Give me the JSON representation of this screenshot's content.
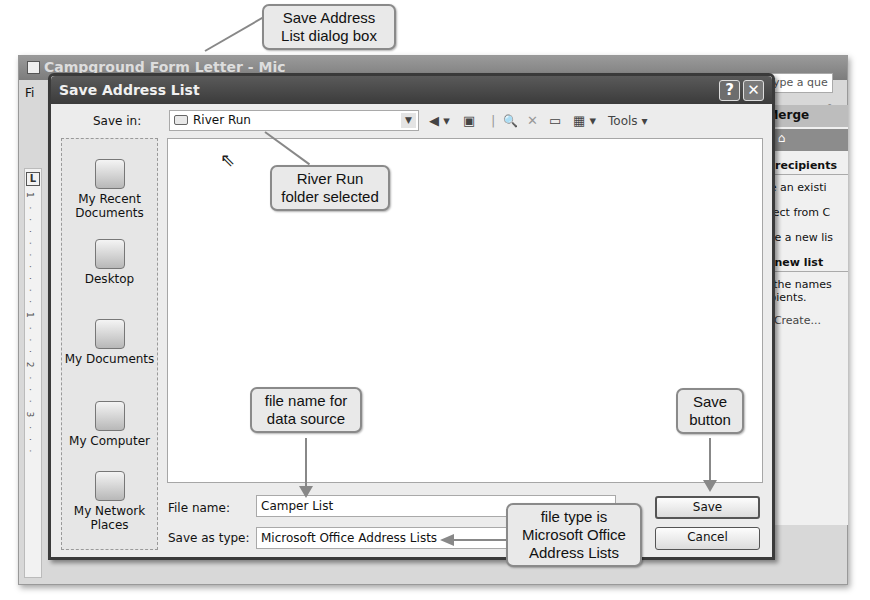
{
  "word_window": {
    "title": "Campground Form Letter - Mic",
    "menu_first": "Fi",
    "ask_placeholder": "Type a que",
    "toolbar_right": "▾ ◎",
    "format_right": "ab▾ A ▾",
    "ruler_tab": "L",
    "ruler_marks": "1 · · · · · · · · · 1 · · · 2 · · · 3 · · ·"
  },
  "task_pane": {
    "header": "il Merge",
    "nav": "⊙ | ⌂",
    "section1": "ect recipients",
    "items": [
      "Use an existi",
      "Select from C",
      "Type a new lis"
    ],
    "section2": "e a new list",
    "description": "pe the names a ipients.",
    "create_link": "Create..."
  },
  "dialog": {
    "title": "Save Address List",
    "help_button": "?",
    "close_button": "✕",
    "save_in_label": "Save in:",
    "save_in_value": "River Run",
    "toolbar": {
      "back": "◀ ▾",
      "up_folder": "▣",
      "search_web": "🔍",
      "delete": "✕",
      "new_folder": "▭",
      "views": "▦ ▾",
      "tools": "Tools ▾"
    },
    "places": [
      {
        "label": "My Recent Documents",
        "icon": "recent-documents-icon"
      },
      {
        "label": "Desktop",
        "icon": "desktop-icon"
      },
      {
        "label": "My Documents",
        "icon": "my-documents-icon"
      },
      {
        "label": "My Computer",
        "icon": "my-computer-icon"
      },
      {
        "label": "My Network Places",
        "icon": "network-places-icon"
      }
    ],
    "file_name_label": "File name:",
    "file_name_value": "Camper List",
    "save_as_type_label": "Save as type:",
    "save_as_type_value": "Microsoft Office Address Lists",
    "save_button": "Save",
    "cancel_button": "Cancel"
  },
  "callouts": {
    "dialog_box": "Save Address List dialog box",
    "folder_selected": "River Run folder selected",
    "file_name": "file name for data source",
    "save_button": "Save button",
    "file_type": "file type is Microsoft Office Address Lists"
  }
}
